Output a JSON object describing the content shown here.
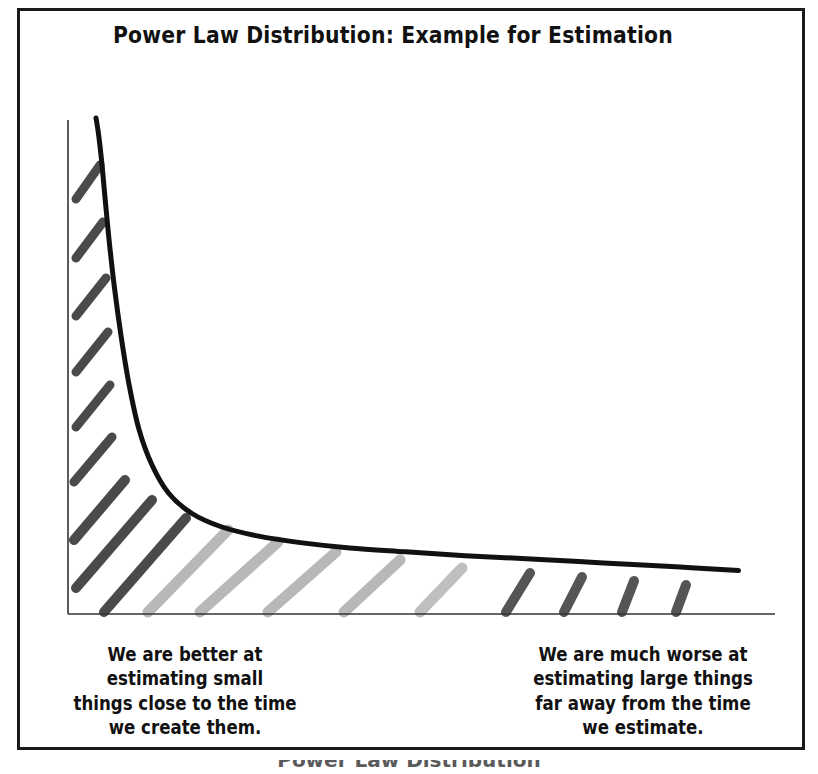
{
  "figure": {
    "title": "Power Law Distribution: Example for Estimation",
    "footer_caption": "Power Law Distribution",
    "frame_color": "#1a1a1a",
    "background": "#ffffff"
  },
  "annotations": {
    "left": {
      "lines": [
        "We are better at",
        "estimating small",
        "things close to the time",
        "we create them."
      ]
    },
    "right": {
      "lines": [
        "We are much worse at",
        "estimating large things",
        "far away from the time",
        "we estimate."
      ]
    }
  },
  "chart_data": {
    "type": "line",
    "title": "Power Law Distribution: Example for Estimation",
    "xlabel": "",
    "ylabel": "",
    "grid": false,
    "legend": false,
    "axis_style": "thin-black-L-shape",
    "curve_color": "#111111",
    "curve_width_px": 5,
    "xlim": [
      0,
      1
    ],
    "ylim": [
      0,
      1
    ],
    "x": [
      0.0,
      0.004,
      0.009,
      0.014,
      0.02,
      0.028,
      0.038,
      0.05,
      0.065,
      0.085,
      0.11,
      0.145,
      0.19,
      0.245,
      0.31,
      0.385,
      0.47,
      0.56,
      0.66,
      0.77,
      0.88,
      0.975
    ],
    "y": [
      1.0,
      0.965,
      0.905,
      0.83,
      0.745,
      0.648,
      0.548,
      0.448,
      0.355,
      0.28,
      0.222,
      0.18,
      0.152,
      0.133,
      0.119,
      0.108,
      0.1,
      0.092,
      0.085,
      0.077,
      0.069,
      0.061
    ],
    "shaded_region": {
      "label": "area under curve filled with diagonal hatch strokes",
      "hatch_dark_color": "#4a4a4a",
      "hatch_mid_color": "#8c8c8c",
      "hatch_light_color": "#bcbcbc"
    },
    "hatch_marks": [
      {
        "x1": 100,
        "y1": 165,
        "x2": 76,
        "y2": 199,
        "color": "#4a4a4a",
        "w": 9
      },
      {
        "x1": 103,
        "y1": 222,
        "x2": 76,
        "y2": 258,
        "color": "#4a4a4a",
        "w": 9
      },
      {
        "x1": 106,
        "y1": 278,
        "x2": 76,
        "y2": 316,
        "color": "#4a4a4a",
        "w": 9
      },
      {
        "x1": 108,
        "y1": 332,
        "x2": 76,
        "y2": 372,
        "color": "#4a4a4a",
        "w": 9
      },
      {
        "x1": 110,
        "y1": 385,
        "x2": 76,
        "y2": 427,
        "color": "#4a4a4a",
        "w": 9
      },
      {
        "x1": 112,
        "y1": 437,
        "x2": 74,
        "y2": 482,
        "color": "#4a4a4a",
        "w": 9
      },
      {
        "x1": 125,
        "y1": 480,
        "x2": 74,
        "y2": 540,
        "color": "#4a4a4a",
        "w": 10
      },
      {
        "x1": 152,
        "y1": 500,
        "x2": 76,
        "y2": 588,
        "color": "#4a4a4a",
        "w": 10
      },
      {
        "x1": 186,
        "y1": 518,
        "x2": 104,
        "y2": 612,
        "color": "#4a4a4a",
        "w": 10
      },
      {
        "x1": 228,
        "y1": 530,
        "x2": 148,
        "y2": 612,
        "color": "#b8b8b8",
        "w": 11
      },
      {
        "x1": 278,
        "y1": 542,
        "x2": 200,
        "y2": 612,
        "color": "#b8b8b8",
        "w": 11
      },
      {
        "x1": 336,
        "y1": 552,
        "x2": 268,
        "y2": 612,
        "color": "#b8b8b8",
        "w": 11
      },
      {
        "x1": 400,
        "y1": 560,
        "x2": 344,
        "y2": 612,
        "color": "#b8b8b8",
        "w": 11
      },
      {
        "x1": 462,
        "y1": 568,
        "x2": 420,
        "y2": 612,
        "color": "#bfbfbf",
        "w": 11
      },
      {
        "x1": 530,
        "y1": 573,
        "x2": 506,
        "y2": 612,
        "color": "#555555",
        "w": 10
      },
      {
        "x1": 582,
        "y1": 577,
        "x2": 564,
        "y2": 612,
        "color": "#555555",
        "w": 10
      },
      {
        "x1": 634,
        "y1": 581,
        "x2": 622,
        "y2": 612,
        "color": "#555555",
        "w": 10
      },
      {
        "x1": 686,
        "y1": 585,
        "x2": 676,
        "y2": 612,
        "color": "#555555",
        "w": 10
      }
    ],
    "axes": {
      "y_axis": {
        "x": 68,
        "y_top": 120,
        "y_bottom": 614
      },
      "x_axis": {
        "y": 614,
        "x_left": 68,
        "x_right": 775
      }
    }
  }
}
